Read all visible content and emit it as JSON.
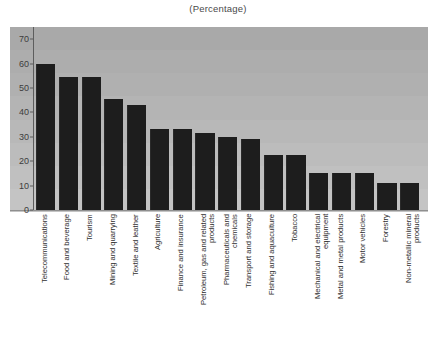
{
  "chart_data": {
    "type": "bar",
    "title": "(Percentage)",
    "subtitle": "",
    "xlabel": "",
    "ylabel": "",
    "ylim": [
      0,
      75
    ],
    "yticks": [
      0,
      10,
      20,
      30,
      40,
      50,
      60,
      70
    ],
    "grid": true,
    "legend": "none",
    "orientation": "vertical",
    "bar_color": "#1d1d1d",
    "plot_background": "#b2b2b2",
    "categories": [
      "Telecommunications",
      "Food and beverage",
      "Tourism",
      "Mining and quarrying",
      "Textile and leather",
      "Agriculture",
      "Finance and insurance",
      "Petroleum, gas and related\nproducts",
      "Pharmaceuticals and\nchemicals",
      "Transport and storage",
      "Fishing and aquaculture",
      "Tobacco",
      "Mechanical and electrical\nequipment",
      "Metal and metal products",
      "Motor vehicles",
      "Forestry",
      "Non-metallic mineral\nproducts"
    ],
    "values": [
      60,
      54.5,
      54.5,
      45.5,
      43,
      33,
      33,
      31.5,
      30,
      29,
      22.5,
      22.5,
      15,
      15,
      15,
      11,
      11
    ]
  }
}
